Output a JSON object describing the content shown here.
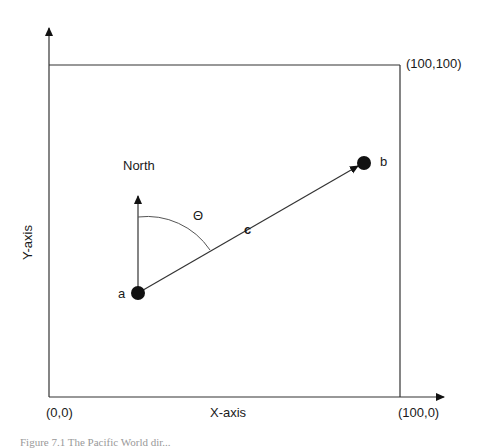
{
  "diagram": {
    "axes": {
      "x_label": "X-axis",
      "y_label": "Y-axis",
      "origin_label": "(0,0)",
      "x_max_label": "(100,0)",
      "corner_label": "(100,100)"
    },
    "points": {
      "a": "a",
      "b": "b"
    },
    "north_label": "North",
    "angle_label": "Θ",
    "vector_label": "c",
    "caption": "Figure 7.1 The Pacific World dir..."
  }
}
